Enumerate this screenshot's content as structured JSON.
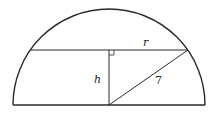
{
  "diagram": {
    "type": "geometry",
    "shape": "semicircle",
    "labels": {
      "radius": "r",
      "height": "h",
      "hypotenuse": "7"
    },
    "colors": {
      "stroke": "#2a2a2a",
      "background": "#ffffff"
    }
  }
}
